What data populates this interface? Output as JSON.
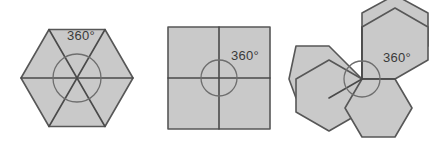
{
  "figure": {
    "background_color": "#ffffff",
    "fill_color": "#c9c9c9",
    "stroke_color": "#575757",
    "line_color": "#4a4a4a",
    "circle_color": "#6e6e6e",
    "text_color": "#3a3a3a"
  },
  "diagrams": [
    {
      "id": "hexagon-six-triangles",
      "shape": "hexagon-divided-into-six-triangles",
      "label": "360°",
      "center": {
        "x": 77,
        "y": 78
      },
      "circumradius": 56,
      "arc_circle_radius": 24,
      "sector_count": 6,
      "label_position": {
        "x": 81,
        "y": 40
      }
    },
    {
      "id": "square-four-quadrants",
      "shape": "square-divided-into-four-quadrants",
      "label": "360°",
      "center": {
        "x": 219,
        "y": 78
      },
      "half_side": 51,
      "arc_circle_radius": 18,
      "sector_count": 4,
      "label_position": {
        "x": 245,
        "y": 60
      }
    },
    {
      "id": "three-hexagons-at-point",
      "shape": "three-hexagons-meeting-at-a-point",
      "label": "360°",
      "center": {
        "x": 362,
        "y": 79
      },
      "hexagon_circumradius": 38,
      "arc_circle_radius": 18,
      "sector_count": 3,
      "label_position": {
        "x": 397,
        "y": 62
      }
    }
  ]
}
